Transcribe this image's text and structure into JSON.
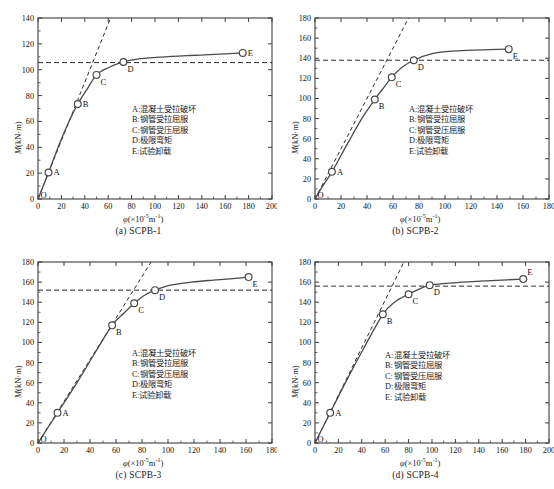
{
  "figure": {
    "axis_color": "#3c3c3c",
    "curve_color": "#4a4a4a",
    "marker_fill": "#ffffff",
    "fineprint": ""
  },
  "legend_items": [
    {
      "key": "A:",
      "text": "混凝土受拉破坏"
    },
    {
      "key": "B:",
      "text": "钢管受拉屈服"
    },
    {
      "key": "C:",
      "text": "钢管受压屈服"
    },
    {
      "key": "D:",
      "text": "极限弯矩"
    },
    {
      "key": "E:",
      "text": "试验卸载"
    }
  ],
  "chart_data": [
    {
      "type": "line",
      "panel": "a",
      "caption": "(a) SCPB-1",
      "title": "",
      "xlabel": "φ(×10⁻⁵m⁻¹)",
      "ylabel": "M(kN·m)",
      "xlim": [
        0,
        200
      ],
      "ylim": [
        0,
        140
      ],
      "xticks": [
        0,
        20,
        40,
        60,
        80,
        100,
        120,
        140,
        160,
        180,
        200
      ],
      "yticks": [
        0,
        20,
        40,
        60,
        80,
        100,
        120,
        140
      ],
      "grid": false,
      "legend_position": "center-right",
      "reference_line_y": 105.5,
      "tangent_line": [
        [
          0,
          0
        ],
        [
          62,
          140
        ]
      ],
      "series": [
        {
          "name": "M-φ curve",
          "x": [
            0,
            4,
            9,
            18,
            26,
            34,
            42,
            50,
            60,
            73,
            88,
            105,
            130,
            155,
            175
          ],
          "y": [
            0,
            9,
            20.5,
            42,
            59,
            73.5,
            85,
            96,
            101.5,
            106,
            108.5,
            109.8,
            111,
            112,
            113
          ]
        }
      ],
      "markers": [
        {
          "label": "O",
          "x": 0,
          "y": 0,
          "pos": "right"
        },
        {
          "label": "A",
          "x": 9,
          "y": 20.5,
          "pos": "right"
        },
        {
          "label": "B",
          "x": 34,
          "y": 73.5,
          "pos": "right"
        },
        {
          "label": "C",
          "x": 50,
          "y": 96,
          "pos": "below-right"
        },
        {
          "label": "D",
          "x": 73,
          "y": 106,
          "pos": "below-right"
        },
        {
          "label": "E",
          "x": 175,
          "y": 113,
          "pos": "right"
        }
      ]
    },
    {
      "type": "line",
      "panel": "b",
      "caption": "(b) SCPB-2",
      "title": "",
      "xlabel": "φ(×10⁻⁵m⁻¹)",
      "ylabel": "M(kN·m)",
      "xlim": [
        0,
        180
      ],
      "ylim": [
        0,
        180
      ],
      "xticks": [
        0,
        20,
        40,
        60,
        80,
        100,
        120,
        140,
        160,
        180
      ],
      "yticks": [
        0,
        20,
        40,
        60,
        80,
        100,
        120,
        140,
        160,
        180
      ],
      "grid": false,
      "legend_position": "center-right",
      "reference_line_y": 138,
      "tangent_line": [
        [
          0,
          0
        ],
        [
          72,
          180
        ]
      ],
      "series": [
        {
          "name": "M-φ curve",
          "x": [
            0,
            6,
            13,
            25,
            36,
            46,
            53,
            59,
            67,
            76,
            90,
            105,
            120,
            135,
            149
          ],
          "y": [
            0,
            13,
            27,
            55,
            80,
            99,
            111,
            121,
            131,
            138,
            144.5,
            147,
            148,
            148.6,
            149
          ]
        }
      ],
      "markers": [
        {
          "label": "O",
          "x": 0,
          "y": 0,
          "pos": "right"
        },
        {
          "label": "A",
          "x": 13,
          "y": 27,
          "pos": "right"
        },
        {
          "label": "B",
          "x": 46,
          "y": 99,
          "pos": "below-right"
        },
        {
          "label": "C",
          "x": 59,
          "y": 121,
          "pos": "below-right"
        },
        {
          "label": "D",
          "x": 76,
          "y": 138,
          "pos": "below-right"
        },
        {
          "label": "E",
          "x": 149,
          "y": 149,
          "pos": "below-right"
        }
      ]
    },
    {
      "type": "line",
      "panel": "c",
      "caption": "(c) SCPB-3",
      "title": "",
      "xlabel": "φ(×10⁻⁵m⁻¹)",
      "ylabel": "M(kN·m)",
      "xlim": [
        0,
        180
      ],
      "ylim": [
        0,
        180
      ],
      "xticks": [
        0,
        20,
        40,
        60,
        80,
        100,
        120,
        140,
        160,
        180
      ],
      "yticks": [
        0,
        20,
        40,
        60,
        80,
        100,
        120,
        140,
        160,
        180
      ],
      "grid": false,
      "legend_position": "center-right",
      "reference_line_y": 152,
      "tangent_line": [
        [
          0,
          0
        ],
        [
          87,
          180
        ]
      ],
      "series": [
        {
          "name": "M-φ curve",
          "x": [
            0,
            7,
            15,
            30,
            44,
            57,
            66,
            74,
            82,
            90,
            102,
            118,
            135,
            150,
            162
          ],
          "y": [
            0,
            14,
            30,
            60,
            90,
            117,
            129,
            139,
            147,
            152,
            157,
            160,
            162,
            163.5,
            165
          ]
        }
      ],
      "markers": [
        {
          "label": "O",
          "x": 0,
          "y": 0,
          "pos": "right"
        },
        {
          "label": "A",
          "x": 15,
          "y": 30,
          "pos": "right"
        },
        {
          "label": "B",
          "x": 57,
          "y": 117,
          "pos": "below-right"
        },
        {
          "label": "C",
          "x": 74,
          "y": 139,
          "pos": "below-right"
        },
        {
          "label": "D",
          "x": 90,
          "y": 152,
          "pos": "below-right"
        },
        {
          "label": "E",
          "x": 162,
          "y": 165,
          "pos": "below-right"
        }
      ]
    },
    {
      "type": "line",
      "panel": "d",
      "caption": "(d) SCPB-4",
      "title": "",
      "xlabel": "φ(×10⁻⁵m⁻¹)",
      "ylabel": "M(kN·m)",
      "xlim": [
        0,
        200
      ],
      "ylim": [
        0,
        180
      ],
      "xticks": [
        0,
        20,
        40,
        60,
        80,
        100,
        120,
        140,
        160,
        180,
        200
      ],
      "yticks": [
        0,
        20,
        40,
        60,
        80,
        100,
        120,
        140,
        160,
        180
      ],
      "grid": false,
      "legend_position": "center-right",
      "reference_line_y": 156,
      "tangent_line": [
        [
          0,
          0
        ],
        [
          76,
          180
        ]
      ],
      "series": [
        {
          "name": "M-φ curve",
          "x": [
            0,
            6,
            13,
            26,
            42,
            58,
            68,
            80,
            90,
            98,
            115,
            135,
            155,
            178
          ],
          "y": [
            0,
            14,
            30,
            60,
            95,
            128,
            140,
            148,
            153.5,
            157,
            159,
            160.5,
            161.8,
            163
          ]
        }
      ],
      "markers": [
        {
          "label": "O",
          "x": 0,
          "y": 0,
          "pos": "right"
        },
        {
          "label": "A",
          "x": 13,
          "y": 30,
          "pos": "right"
        },
        {
          "label": "B",
          "x": 58,
          "y": 128,
          "pos": "below-right"
        },
        {
          "label": "C",
          "x": 80,
          "y": 148,
          "pos": "below-right"
        },
        {
          "label": "D",
          "x": 98,
          "y": 157,
          "pos": "below-right"
        },
        {
          "label": "E",
          "x": 178,
          "y": 163,
          "pos": "above-right"
        }
      ]
    }
  ]
}
